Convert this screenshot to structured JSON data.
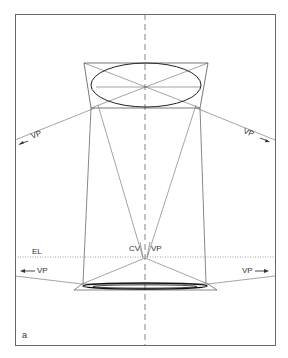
{
  "figure": {
    "panel_label": "a",
    "labels": {
      "eye_level": "EL",
      "center_of_vision": "CV",
      "vanishing_point": "VP",
      "vp_upper_left": "VP",
      "vp_upper_right": "VP",
      "vp_lower_left": "VP",
      "vp_lower_right": "VP"
    },
    "colors": {
      "line": "#555555",
      "ellipse": "#222222",
      "frame": "#666666",
      "background": "#ffffff"
    }
  }
}
